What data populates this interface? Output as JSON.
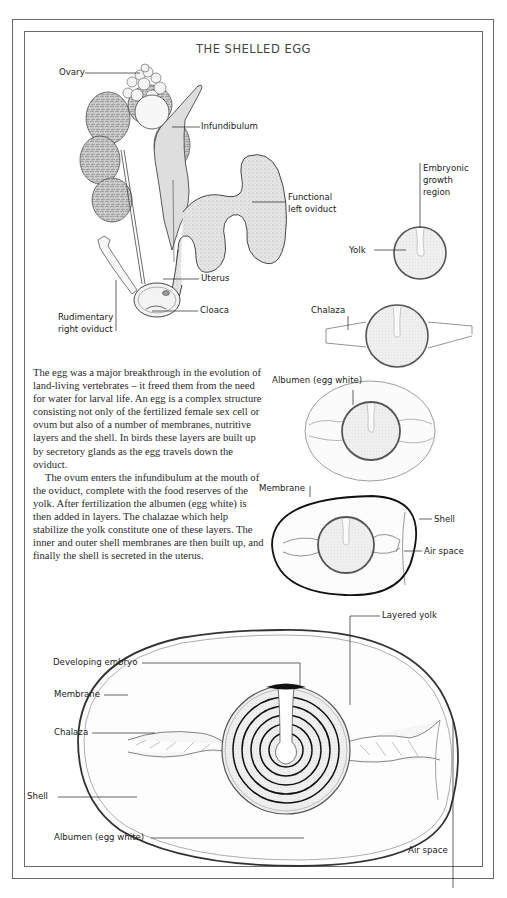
{
  "title": "THE SHELLED EGG",
  "reproductive_tract": {
    "labels": {
      "ovary": "Ovary",
      "infundibulum": "Infundibulum",
      "functional_left_oviduct_1": "Functional",
      "functional_left_oviduct_2": "left oviduct",
      "uterus": "Uterus",
      "cloaca": "Cloaca",
      "rudimentary_1": "Rudimentary",
      "rudimentary_2": "right oviduct"
    }
  },
  "stages": {
    "yolk_stage": {
      "embryonic_1": "Embryonic",
      "embryonic_2": "growth",
      "embryonic_3": "region",
      "yolk": "Yolk"
    },
    "chalaza_stage": {
      "chalaza": "Chalaza"
    },
    "albumen_stage": {
      "albumen": "Albumen (egg white)"
    },
    "shell_stage": {
      "membrane": "Membrane",
      "shell": "Shell",
      "air_space": "Air space"
    }
  },
  "body_text": {
    "paragraph_1": "The egg was a major breakthrough in the evolution of land-living vertebrates – it freed them from the need for water for larval life. An egg is a complex structure consisting not only of the fertilized female sex cell or ovum but also of a number of membranes, nutritive layers and the shell. In birds these layers are built up by secretory glands as the egg travels down the oviduct.",
    "paragraph_2": "The ovum enters the infundibulum at the mouth of the oviduct, complete with the food reserves of the yolk. After fertilization the albumen (egg white) is then added in layers. The chalazae which help stabilize the yolk constitute one of these layers. The inner and outer shell membranes are then built up, and finally the shell is secreted in the uterus."
  },
  "large_egg": {
    "labels": {
      "developing_embryo": "Developing embryo",
      "layered_yolk": "Layered yolk",
      "membrane": "Membrane",
      "chalaza": "Chalaza",
      "shell": "Shell",
      "albumen": "Albumen (egg white)",
      "air_space": "Air space"
    }
  },
  "colors": {
    "frame": "#6a6a6a",
    "line": "#333333",
    "yolk_fill": "#ececec",
    "tissue_fill": "#dcdcdc",
    "embryo": "#111111"
  }
}
